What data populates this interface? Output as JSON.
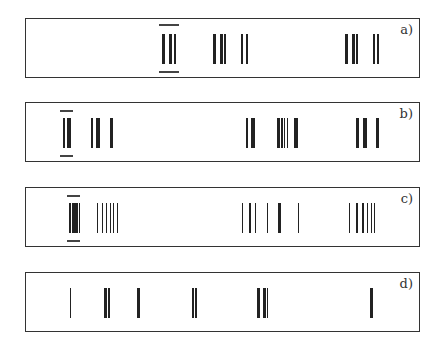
{
  "panels": [
    {
      "label": "a)",
      "top": 18,
      "line_top": 15,
      "line_height": 30,
      "highlight": {
        "x": 158,
        "w": 20,
        "top_y": 5,
        "bottom_y": 52
      },
      "lines": [
        {
          "x": 161,
          "w": 3
        },
        {
          "x": 168,
          "w": 3
        },
        {
          "x": 173,
          "w": 2
        },
        {
          "x": 212,
          "w": 3
        },
        {
          "x": 219,
          "w": 3
        },
        {
          "x": 223,
          "w": 2
        },
        {
          "x": 240,
          "w": 2
        },
        {
          "x": 245,
          "w": 2
        },
        {
          "x": 344,
          "w": 3
        },
        {
          "x": 351,
          "w": 3
        },
        {
          "x": 355,
          "w": 2
        },
        {
          "x": 372,
          "w": 2
        },
        {
          "x": 376,
          "w": 2
        }
      ]
    },
    {
      "label": "b)",
      "top": 102,
      "line_top": 15,
      "line_height": 30,
      "highlight": {
        "x": 59,
        "w": 13,
        "top_y": 7,
        "bottom_y": 52
      },
      "lines": [
        {
          "x": 62,
          "w": 2
        },
        {
          "x": 66,
          "w": 4
        },
        {
          "x": 90,
          "w": 2
        },
        {
          "x": 95,
          "w": 4
        },
        {
          "x": 109,
          "w": 3
        },
        {
          "x": 245,
          "w": 2
        },
        {
          "x": 250,
          "w": 4
        },
        {
          "x": 276,
          "w": 3
        },
        {
          "x": 280,
          "w": 2
        },
        {
          "x": 283,
          "w": 1
        },
        {
          "x": 286,
          "w": 1
        },
        {
          "x": 293,
          "w": 4
        },
        {
          "x": 355,
          "w": 3
        },
        {
          "x": 362,
          "w": 4
        },
        {
          "x": 375,
          "w": 3
        }
      ]
    },
    {
      "label": "c)",
      "top": 187,
      "line_top": 15,
      "line_height": 30,
      "highlight": {
        "x": 66,
        "w": 13,
        "top_y": 7,
        "bottom_y": 52
      },
      "lines": [
        {
          "x": 68,
          "w": 2
        },
        {
          "x": 71,
          "w": 2
        },
        {
          "x": 73,
          "w": 3
        },
        {
          "x": 76,
          "w": 1
        },
        {
          "x": 78,
          "w": 1
        },
        {
          "x": 96,
          "w": 1
        },
        {
          "x": 101,
          "w": 1
        },
        {
          "x": 105,
          "w": 1
        },
        {
          "x": 109,
          "w": 1
        },
        {
          "x": 112,
          "w": 1
        },
        {
          "x": 116,
          "w": 1
        },
        {
          "x": 241,
          "w": 1
        },
        {
          "x": 248,
          "w": 2
        },
        {
          "x": 254,
          "w": 1
        },
        {
          "x": 266,
          "w": 1
        },
        {
          "x": 277,
          "w": 3
        },
        {
          "x": 297,
          "w": 1
        },
        {
          "x": 348,
          "w": 1
        },
        {
          "x": 355,
          "w": 2
        },
        {
          "x": 361,
          "w": 2
        },
        {
          "x": 366,
          "w": 1
        },
        {
          "x": 370,
          "w": 1
        },
        {
          "x": 373,
          "w": 1
        }
      ]
    },
    {
      "label": "d)",
      "top": 272,
      "line_top": 15,
      "line_height": 30,
      "highlight": null,
      "lines": [
        {
          "x": 69,
          "w": 1
        },
        {
          "x": 103,
          "w": 3
        },
        {
          "x": 107,
          "w": 2
        },
        {
          "x": 136,
          "w": 3
        },
        {
          "x": 191,
          "w": 2
        },
        {
          "x": 194,
          "w": 2
        },
        {
          "x": 256,
          "w": 3
        },
        {
          "x": 262,
          "w": 3
        },
        {
          "x": 266,
          "w": 1
        },
        {
          "x": 369,
          "w": 3
        }
      ]
    }
  ]
}
